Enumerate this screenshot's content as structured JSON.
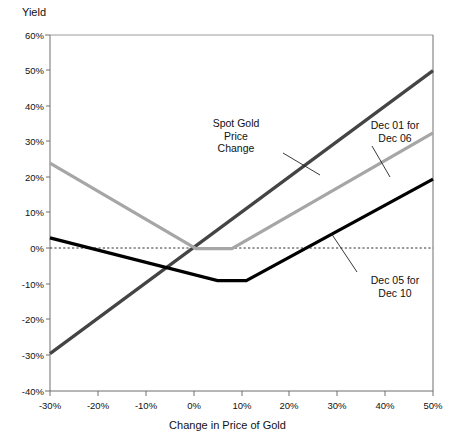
{
  "chart_data": {
    "type": "line",
    "title": "",
    "xlabel": "Change in Price of Gold",
    "ylabel": "Yield",
    "xlim": [
      -30,
      50
    ],
    "ylim": [
      -40,
      60
    ],
    "xticks": [
      "-30%",
      "-20%",
      "-10%",
      "0%",
      "10%",
      "20%",
      "30%",
      "40%",
      "50%"
    ],
    "xtick_values": [
      -30,
      -20,
      -10,
      0,
      10,
      20,
      30,
      40,
      50
    ],
    "yticks": [
      "60%",
      "50%",
      "40%",
      "30%",
      "20%",
      "10%",
      "0%",
      "-10%",
      "-20%",
      "-30%",
      "-40%"
    ],
    "ytick_values": [
      60,
      50,
      40,
      30,
      20,
      10,
      0,
      -10,
      -20,
      -30,
      -40
    ],
    "grid": false,
    "zero_line": true,
    "legend": "annotations",
    "series": [
      {
        "name": "Spot Gold Price Change",
        "color": "#444444",
        "width": 3.2,
        "x": [
          -30,
          50
        ],
        "y": [
          -29.5,
          50.0
        ]
      },
      {
        "name": "Dec 01 for Dec 06",
        "color": "#a6a6a6",
        "width": 3.2,
        "x": [
          -30,
          0.5,
          8.0,
          50
        ],
        "y": [
          24.0,
          0.0,
          0.0,
          32.5
        ]
      },
      {
        "name": "Dec 05 for Dec 10",
        "color": "#000000",
        "width": 3.2,
        "x": [
          -30,
          5.0,
          11.0,
          50
        ],
        "y": [
          3.0,
          -9.0,
          -9.0,
          19.5
        ]
      }
    ],
    "annotations": [
      {
        "id": "spot-gold",
        "text": "Spot Gold\nPrice\nChange",
        "target_x": 23.5,
        "target_y": 22.0
      },
      {
        "id": "dec01-dec06",
        "text": "Dec 01 for\nDec 06",
        "target_x": 34.0,
        "target_y": 14.5
      },
      {
        "id": "dec05-dec10",
        "text": "Dec 05 for\nDec 10",
        "target_x": 29.5,
        "target_y": 3.5
      }
    ]
  },
  "axes": {
    "ylabel": "Yield",
    "xlabel": "Change in Price of Gold"
  },
  "annotations": {
    "spot_gold": "Spot Gold\nPrice\nChange",
    "dec01": "Dec 01 for\nDec 06",
    "dec05": "Dec 05 for\nDec 10"
  }
}
